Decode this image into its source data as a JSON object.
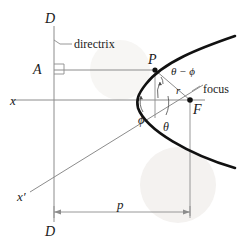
{
  "figure": {
    "type": "geometry-diagram",
    "background_color": "#ffffff",
    "ink_color": "#1a1a1a",
    "thin_line_color": "#8c8c8c",
    "curve_color": "#111111",
    "watermark_color": "#f2f0ee"
  },
  "labels": {
    "directrix_top": "D",
    "directrix_bottom": "D",
    "directrix_callout": "directrix",
    "point_a": "A",
    "point_p": "P",
    "point_f": "F",
    "focus": "focus",
    "axis_x": "x",
    "axis_x_prime": "x′",
    "radius_r": "r",
    "angle_theta": "θ",
    "angle_phi": "ϕ",
    "angle_theta_minus_phi": "θ − ϕ",
    "distance_p": "p"
  },
  "geometry": {
    "directrix_x": 54,
    "directrix_y_top": 26,
    "directrix_y_bottom": 222,
    "axis_y": 100,
    "axis_x_left": 12,
    "axis_x_right": 205,
    "focus_point": [
      190,
      100
    ],
    "point_p": [
      155,
      70
    ],
    "point_a": [
      54,
      70
    ],
    "vertex_x": 133,
    "p_dimension_y": 212,
    "p_dimension_from": 54,
    "p_dimension_to": 190,
    "x_prime_from": [
      30,
      192
    ],
    "x_prime_to": [
      203,
      85
    ]
  }
}
